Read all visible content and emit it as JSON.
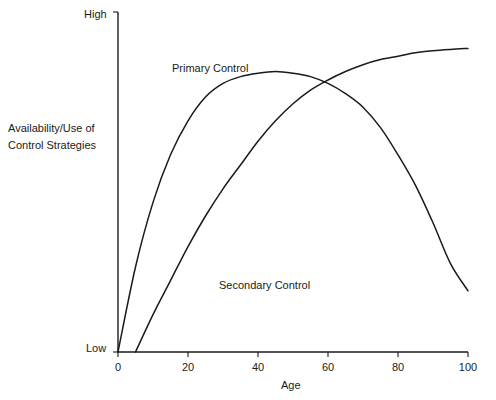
{
  "chart_data": {
    "type": "line",
    "title": "",
    "xlabel": "Age",
    "ylabel": "Availability/Use of Control Strategies",
    "xlim": [
      0,
      100
    ],
    "ylim": [
      0,
      100
    ],
    "grid": false,
    "legend_position": "inline-annotations",
    "x_tick_labels": [
      "0",
      "20",
      "40",
      "60",
      "80",
      "100"
    ],
    "x_tick_values": [
      0,
      20,
      40,
      60,
      80,
      100
    ],
    "y_tick_labels": [
      "Low",
      "High"
    ],
    "y_tick_values": [
      0,
      100
    ],
    "annotations": [
      {
        "text": "Primary Control",
        "x": 16,
        "y": 86
      },
      {
        "text": "Secondary Control",
        "x": 30,
        "y": 22
      }
    ],
    "series": [
      {
        "name": "Primary Control",
        "x": [
          0,
          5,
          10,
          15,
          20,
          25,
          30,
          35,
          40,
          45,
          50,
          55,
          60,
          65,
          70,
          75,
          80,
          85,
          90,
          95,
          100
        ],
        "y": [
          0,
          25,
          44,
          58,
          68,
          75,
          79,
          81,
          82,
          82.5,
          82,
          81,
          79,
          76,
          72,
          66,
          58,
          49,
          38,
          26,
          18
        ]
      },
      {
        "name": "Secondary Control",
        "x": [
          0,
          5,
          10,
          15,
          20,
          25,
          30,
          35,
          40,
          45,
          50,
          55,
          60,
          65,
          70,
          75,
          80,
          85,
          90,
          95,
          100
        ],
        "y": [
          0,
          0,
          11,
          21,
          31,
          40,
          48,
          55,
          62,
          68,
          73,
          77,
          80,
          82.5,
          84.5,
          86,
          87,
          88,
          88.6,
          89,
          89.3
        ]
      }
    ]
  },
  "axis": {
    "y_high_label": "High",
    "y_low_label": "Low",
    "y_axis_title": "Availability/Use of Control Strategies",
    "x_axis_title": "Age",
    "x_ticks": [
      "0",
      "20",
      "40",
      "60",
      "80",
      "100"
    ]
  },
  "labels": {
    "primary": "Primary Control",
    "secondary": "Secondary Control"
  },
  "colors": {
    "background": "#ffffff",
    "axis": "#1a1a1a",
    "curve": "#1a1a1a",
    "text": "#1a1a1a"
  }
}
